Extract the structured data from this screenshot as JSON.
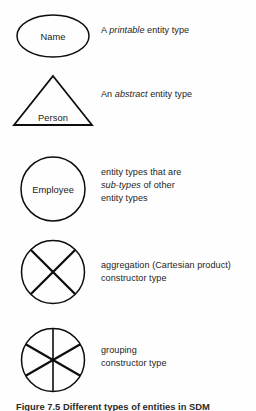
{
  "figure": {
    "caption_label": "Figure 7.5",
    "caption_text": "Different types of entities in SDM",
    "rows": [
      {
        "symbol_name": "ellipse-entity-symbol",
        "shape": "ellipse",
        "label": "Name",
        "desc_lines": [
          {
            "pre": "A ",
            "em": "printable",
            "post": " entity type"
          }
        ]
      },
      {
        "symbol_name": "triangle-entity-symbol",
        "shape": "triangle",
        "label": "Person",
        "desc_lines": [
          {
            "pre": "An ",
            "em": "abstract",
            "post": " entity type"
          }
        ]
      },
      {
        "symbol_name": "circle-entity-symbol",
        "shape": "circle",
        "label": "Employee",
        "desc_lines": [
          {
            "pre": "entity types that are",
            "em": "",
            "post": ""
          },
          {
            "pre": "",
            "em": "sub-types",
            "post": " of other"
          },
          {
            "pre": "entity types",
            "em": "",
            "post": ""
          }
        ]
      },
      {
        "symbol_name": "aggregation-constructor-symbol",
        "shape": "circle-cross",
        "label": "",
        "desc_lines": [
          {
            "pre": "aggregation (Cartesian product)",
            "em": "",
            "post": ""
          },
          {
            "pre": "constructor type",
            "em": "",
            "post": ""
          }
        ]
      },
      {
        "symbol_name": "grouping-constructor-symbol",
        "shape": "circle-spokes",
        "label": "",
        "desc_lines": [
          {
            "pre": "grouping",
            "em": "",
            "post": ""
          },
          {
            "pre": "constructor type",
            "em": "",
            "post": ""
          }
        ]
      }
    ]
  },
  "colors": {
    "ink": "#0d0d0d",
    "text": "#1d1d1d",
    "paper": "#fefefe"
  }
}
